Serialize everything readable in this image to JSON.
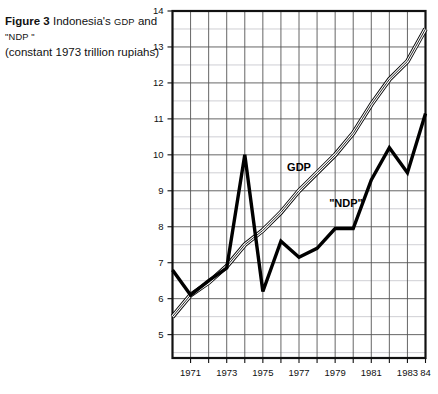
{
  "caption": {
    "figure_number": "Figure 3",
    "text_part1": "Indonesia's",
    "gdp_small": "GDP",
    "text_part2": "and",
    "ndp_small": "\"NDP \"",
    "subtitle": "(constant 1973 trillion rupiahs)"
  },
  "chart_data": {
    "type": "line",
    "xlabel": "",
    "ylabel": "",
    "xlim": [
      1970,
      1984
    ],
    "ylim": [
      4.35,
      14
    ],
    "yticks": [
      5,
      6,
      7,
      8,
      9,
      10,
      11,
      12,
      13,
      14
    ],
    "ytick_labels": [
      "5",
      "6",
      "7",
      "8",
      "9",
      "10",
      "11",
      "12",
      "13",
      "14"
    ],
    "y_minor_step": 0.5,
    "xticks": [
      1971,
      1973,
      1975,
      1977,
      1979,
      1981,
      1983,
      1984
    ],
    "xtick_labels": [
      "1971",
      "1973",
      "1975",
      "1977",
      "1979",
      "1981",
      "1983",
      "84"
    ],
    "x_gridline_step": 1,
    "grid": true,
    "legend": "inline-labels",
    "series": [
      {
        "name": "GDP",
        "style": "double-outline",
        "label_x": 1977.0,
        "label_y": 9.55,
        "x": [
          1970,
          1971,
          1972,
          1973,
          1974,
          1975,
          1976,
          1977,
          1978,
          1979,
          1980,
          1981,
          1982,
          1983,
          1984
        ],
        "values": [
          5.5,
          6.1,
          6.45,
          6.9,
          7.5,
          7.9,
          8.4,
          9.0,
          9.5,
          10.0,
          10.6,
          11.4,
          12.1,
          12.6,
          13.5
        ]
      },
      {
        "name": "\"NDP\"",
        "style": "solid-thick",
        "label_x": 1979.6,
        "label_y": 8.55,
        "x": [
          1970,
          1971,
          1972,
          1973,
          1974,
          1975,
          1976,
          1977,
          1978,
          1979,
          1980,
          1981,
          1982,
          1983,
          1984
        ],
        "values": [
          6.8,
          6.1,
          6.5,
          6.85,
          10.0,
          6.2,
          7.6,
          7.15,
          7.4,
          7.95,
          7.95,
          9.3,
          10.2,
          9.5,
          11.15
        ]
      }
    ],
    "colors": {
      "line": "#000000",
      "grid_major": "#555555",
      "grid_minor": "#c9c9cf",
      "axis": "#111111",
      "background": "#ffffff"
    }
  }
}
